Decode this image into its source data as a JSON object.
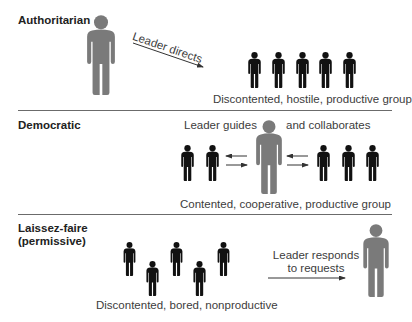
{
  "sections": [
    {
      "id": "authoritarian",
      "title": "Authoritarian",
      "leader_action": "Leader directs",
      "group_caption": "Discontented, hostile, productive group",
      "group_size": 5
    },
    {
      "id": "democratic",
      "title": "Democratic",
      "leader_action_left": "Leader guides",
      "leader_action_right": "and collaborates",
      "group_caption": "Contented, cooperative, productive group",
      "group_size": 5
    },
    {
      "id": "laissez-faire",
      "title_line1": "Laissez-faire",
      "title_line2": "(permissive)",
      "leader_action_line1": "Leader responds",
      "leader_action_line2": "to requests",
      "group_caption": "Discontented, bored, nonproductive",
      "group_size": 5
    }
  ],
  "colors": {
    "leader": "#7a7a7a",
    "member": "#111111",
    "divider": "#6b6b6b",
    "arrow": "#333333"
  },
  "icons": {
    "leader": "person-icon-gray-large",
    "member": "person-icon-black-small",
    "arrow": "arrow-right"
  }
}
